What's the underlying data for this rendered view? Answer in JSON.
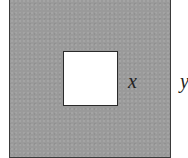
{
  "diagram": {
    "outer_square": {
      "fill": "#9a9a9a",
      "side_label": "y"
    },
    "inner_square": {
      "fill": "#ffffff",
      "side_label": "x"
    },
    "labels": {
      "inner": "x",
      "outer": "y"
    }
  }
}
